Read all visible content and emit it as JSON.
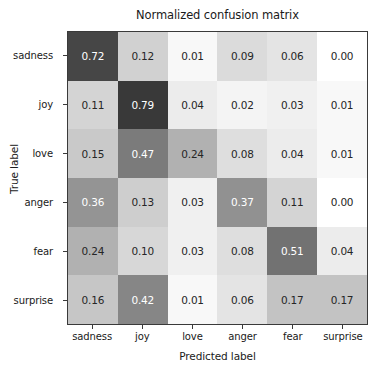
{
  "chart_data": {
    "type": "heatmap",
    "title": "Normalized confusion matrix",
    "xlabel": "Predicted label",
    "ylabel": "True label",
    "categories": [
      "sadness",
      "joy",
      "love",
      "anger",
      "fear",
      "surprise"
    ],
    "x_tick_labels": [
      "sadness",
      "joy",
      "love",
      "anger",
      "fear",
      "surprise"
    ],
    "y_tick_labels": [
      "sadness",
      "joy",
      "love",
      "anger",
      "fear",
      "surprise"
    ],
    "colormap": "greys",
    "vmin": 0.0,
    "vmax": 1.0,
    "grid": false,
    "legend": "none",
    "colorbar": false,
    "rows": [
      {
        "label": "sadness",
        "values": [
          0.72,
          0.12,
          0.01,
          0.09,
          0.06,
          0.0
        ],
        "text": [
          "0.72",
          "0.12",
          "0.01",
          "0.09",
          "0.06",
          "0.00"
        ]
      },
      {
        "label": "joy",
        "values": [
          0.11,
          0.79,
          0.04,
          0.02,
          0.03,
          0.01
        ],
        "text": [
          "0.11",
          "0.79",
          "0.04",
          "0.02",
          "0.03",
          "0.01"
        ]
      },
      {
        "label": "love",
        "values": [
          0.15,
          0.47,
          0.24,
          0.08,
          0.04,
          0.01
        ],
        "text": [
          "0.15",
          "0.47",
          "0.24",
          "0.08",
          "0.04",
          "0.01"
        ]
      },
      {
        "label": "anger",
        "values": [
          0.36,
          0.13,
          0.03,
          0.37,
          0.11,
          0.0
        ],
        "text": [
          "0.36",
          "0.13",
          "0.03",
          "0.37",
          "0.11",
          "0.00"
        ]
      },
      {
        "label": "fear",
        "values": [
          0.24,
          0.1,
          0.03,
          0.08,
          0.51,
          0.04
        ],
        "text": [
          "0.24",
          "0.10",
          "0.03",
          "0.08",
          "0.51",
          "0.04"
        ]
      },
      {
        "label": "surprise",
        "values": [
          0.16,
          0.42,
          0.01,
          0.06,
          0.17,
          0.17
        ],
        "text": [
          "0.16",
          "0.42",
          "0.01",
          "0.06",
          "0.17",
          "0.17"
        ]
      }
    ]
  },
  "style": {
    "background": "#ffffff",
    "axis_color": "#3a3a3a",
    "text_color": "#1a1a1a",
    "cell_text_dark": "#262626",
    "cell_text_light": "#ffffff"
  }
}
